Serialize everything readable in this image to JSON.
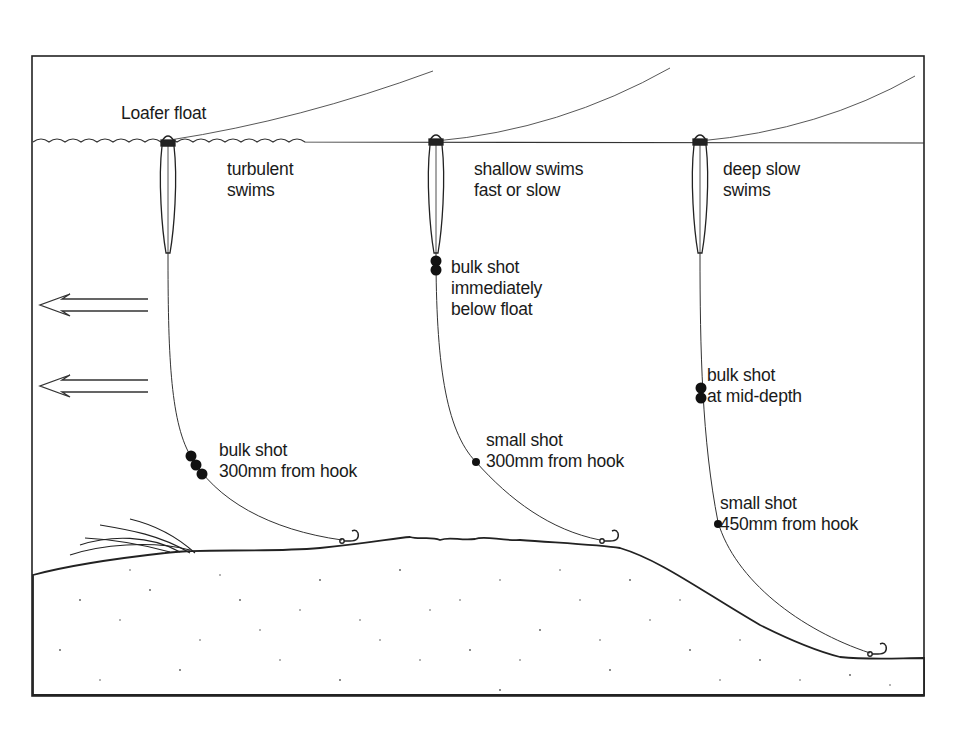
{
  "diagram": {
    "title_fragment": "",
    "surface_label": "Loafer float",
    "current_arrows": 2,
    "rigs": [
      {
        "id": "turbulent",
        "heading": [
          "turbulent",
          "swims"
        ],
        "shot_label": [
          "bulk shot",
          "300mm from hook"
        ],
        "shot_type": "bulk",
        "shot_count": 3
      },
      {
        "id": "shallow",
        "heading": [
          "shallow swims",
          "fast or slow"
        ],
        "shot_label": [
          "bulk shot",
          "immediately",
          "below float"
        ],
        "shot_type": "bulk",
        "shot_count": 2,
        "secondary_label": [
          "small shot",
          "300mm from hook"
        ]
      },
      {
        "id": "deep",
        "heading": [
          "deep slow",
          "swims"
        ],
        "shot_label": [
          "bulk shot",
          "at mid-depth"
        ],
        "shot_type": "bulk",
        "shot_count": 2,
        "secondary_label": [
          "small shot",
          "450mm from hook"
        ]
      }
    ],
    "colors": {
      "ink": "#1a1a1a",
      "line": "#333333",
      "background": "#ffffff"
    }
  }
}
